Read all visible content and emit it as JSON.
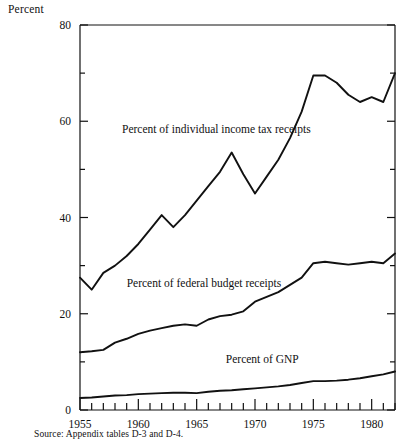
{
  "chart_data": {
    "type": "line",
    "title": "",
    "xlabel": "",
    "ylabel": "Percent",
    "ylim": [
      0,
      80
    ],
    "xlim": [
      1955,
      1982
    ],
    "grid": false,
    "legend_position": "inline-annotations",
    "y_major_ticks": [
      0,
      20,
      40,
      60,
      80
    ],
    "y_minor_ticks": [
      10,
      30,
      50,
      70
    ],
    "x_tick_labels": [
      "1955",
      "1960",
      "1965",
      "1970",
      "1975",
      "1980"
    ],
    "x_tick_values": [
      1955,
      1960,
      1965,
      1970,
      1975,
      1980
    ],
    "x": [
      1955,
      1956,
      1957,
      1958,
      1959,
      1960,
      1961,
      1962,
      1963,
      1964,
      1965,
      1966,
      1967,
      1968,
      1969,
      1970,
      1971,
      1972,
      1973,
      1974,
      1975,
      1976,
      1977,
      1978,
      1979,
      1980,
      1981,
      1982
    ],
    "series": [
      {
        "name": "Percent of individual income tax receipts",
        "label_x": 1958.6,
        "label_y": 57.5,
        "values": [
          27.5,
          25.0,
          28.5,
          30.0,
          32.0,
          34.5,
          37.5,
          40.5,
          38.0,
          40.5,
          43.5,
          46.5,
          49.5,
          53.5,
          49.0,
          45.0,
          48.5,
          52.0,
          56.5,
          62.0,
          69.5,
          69.5,
          68.0,
          65.5,
          64.0,
          65.0,
          64.0,
          70.0
        ]
      },
      {
        "name": "Percent of federal budget receipts",
        "label_x": 1959.0,
        "label_y": 25.5,
        "values": [
          12.0,
          12.2,
          12.5,
          14.0,
          14.8,
          15.8,
          16.5,
          17.0,
          17.5,
          17.8,
          17.5,
          18.8,
          19.5,
          19.8,
          20.5,
          22.5,
          23.5,
          24.5,
          26.0,
          27.5,
          30.5,
          30.8,
          30.5,
          30.2,
          30.5,
          30.8,
          30.5,
          32.5
        ]
      },
      {
        "name": "Percent of GNP",
        "label_x": 1967.5,
        "label_y": 9.8,
        "values": [
          2.5,
          2.6,
          2.8,
          3.0,
          3.1,
          3.3,
          3.4,
          3.5,
          3.6,
          3.6,
          3.5,
          3.8,
          4.0,
          4.1,
          4.3,
          4.5,
          4.7,
          4.9,
          5.2,
          5.6,
          6.0,
          6.0,
          6.1,
          6.3,
          6.6,
          7.0,
          7.4,
          8.0
        ]
      }
    ]
  },
  "source": {
    "note": "Source:  Appendix tables D-3 and D-4."
  }
}
